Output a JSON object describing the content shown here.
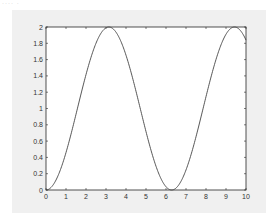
{
  "chart_data": {
    "type": "line",
    "title": "",
    "xlabel": "",
    "ylabel": "",
    "xlim": [
      0,
      10
    ],
    "ylim": [
      0,
      2
    ],
    "grid": false,
    "legend": null,
    "x_ticks": [
      "0",
      "1",
      "2",
      "3",
      "4",
      "5",
      "6",
      "7",
      "8",
      "9",
      "10"
    ],
    "y_ticks": [
      "0",
      "0.2",
      "0.4",
      "0.6",
      "0.8",
      "1",
      "1.2",
      "1.4",
      "1.6",
      "1.8",
      "2"
    ],
    "series": [
      {
        "name": "y = 1 - cos(x)",
        "color": "#444444",
        "x": [
          0,
          0.5,
          1,
          1.5,
          2,
          2.5,
          3,
          3.14,
          3.5,
          4,
          4.5,
          5,
          5.5,
          6,
          6.28,
          6.5,
          7,
          7.5,
          8,
          8.5,
          9,
          9.42,
          9.5,
          10
        ],
        "values": [
          0,
          0.12,
          0.46,
          0.93,
          1.42,
          1.8,
          1.99,
          2.0,
          1.94,
          1.65,
          1.21,
          0.72,
          0.29,
          0.04,
          0,
          0.02,
          0.25,
          0.65,
          1.15,
          1.6,
          1.91,
          2.0,
          2.0,
          1.84
        ]
      }
    ]
  },
  "figure": {
    "top_artifact_text": "···· ·"
  },
  "colors": {
    "figure_background": "#f0f0f0",
    "axes_background": "#ffffff",
    "axes_edge": "#262626",
    "line": "#444444"
  }
}
